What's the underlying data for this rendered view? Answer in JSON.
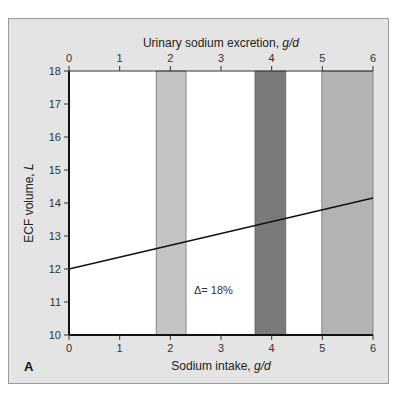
{
  "chart_data": {
    "type": "line",
    "panel_label": "A",
    "title": "",
    "xlabel": "Sodium intake, g/d",
    "xlabel_parts": {
      "text": "Sodium intake, ",
      "unit": "g/d"
    },
    "x2label": "Urinary sodium excretion, g/d",
    "x2label_parts": {
      "text": "Urinary sodium excretion, ",
      "unit": "g/d"
    },
    "ylabel": "ECF volume, L",
    "ylabel_parts": {
      "text": "ECF volume, ",
      "unit": "L"
    },
    "xlim": [
      0,
      6
    ],
    "ylim": [
      10,
      18
    ],
    "x_ticks": [
      "0",
      "1",
      "2",
      "3",
      "4",
      "5",
      "6"
    ],
    "x2_ticks": [
      "0",
      "1",
      "2",
      "3",
      "4",
      "5",
      "6"
    ],
    "y_ticks": [
      "10",
      "11",
      "12",
      "13",
      "14",
      "15",
      "16",
      "17",
      "18"
    ],
    "grid": false,
    "series": [
      {
        "name": "ECF volume vs sodium intake",
        "x": [
          0,
          6
        ],
        "y": [
          12.0,
          14.15
        ],
        "color": "#111111"
      }
    ],
    "bands": [
      {
        "x_start": 1.72,
        "x_end": 2.31,
        "color": "#c4c4c4"
      },
      {
        "x_start": 3.67,
        "x_end": 4.28,
        "color": "#7a7a7a"
      },
      {
        "x_start": 4.99,
        "x_end": 6.0,
        "color": "#b3b3b3"
      }
    ],
    "annotations": [
      {
        "text": "Δ= 18%",
        "x": 2.85,
        "y": 11.35
      }
    ]
  },
  "colors": {
    "panel_bg": "#e4e4e4",
    "plot_bg": "#ffffff",
    "axis": "#111111"
  }
}
